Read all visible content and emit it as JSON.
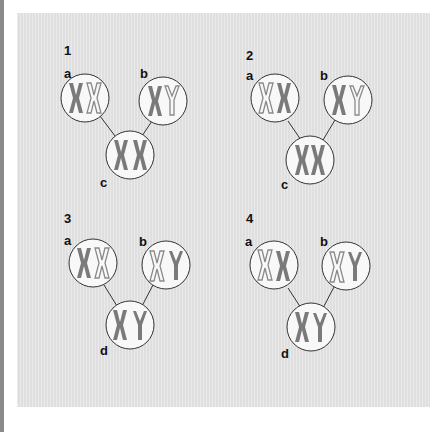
{
  "figure": {
    "colors": {
      "background": "#e3e3e3",
      "circle_fill": "#f8f8f8",
      "circle_stroke": "#333333",
      "chromosome_fill": "#7a7a7a",
      "chromosome_outline": "#8a8a8a",
      "label": "#111111"
    },
    "panels": [
      {
        "number": "1",
        "cells": [
          {
            "label": "a",
            "chromosomes": [
              "X filled",
              "X outline"
            ]
          },
          {
            "label": "b",
            "chromosomes": [
              "X filled",
              "Y outline"
            ]
          },
          {
            "label": "c",
            "chromosomes": [
              "X filled",
              "X filled"
            ]
          }
        ]
      },
      {
        "number": "2",
        "cells": [
          {
            "label": "a",
            "chromosomes": [
              "X outline",
              "X filled"
            ]
          },
          {
            "label": "b",
            "chromosomes": [
              "X filled",
              "Y outline"
            ]
          },
          {
            "label": "c",
            "chromosomes": [
              "X filled",
              "X filled"
            ]
          }
        ]
      },
      {
        "number": "3",
        "cells": [
          {
            "label": "a",
            "chromosomes": [
              "X filled",
              "X outline"
            ]
          },
          {
            "label": "b",
            "chromosomes": [
              "X outline",
              "Y filled"
            ]
          },
          {
            "label": "d",
            "chromosomes": [
              "X filled",
              "Y filled"
            ]
          }
        ]
      },
      {
        "number": "4",
        "cells": [
          {
            "label": "a",
            "chromosomes": [
              "X outline",
              "X filled"
            ]
          },
          {
            "label": "b",
            "chromosomes": [
              "X outline",
              "Y filled"
            ]
          },
          {
            "label": "d",
            "chromosomes": [
              "X filled",
              "Y filled"
            ]
          }
        ]
      }
    ]
  }
}
